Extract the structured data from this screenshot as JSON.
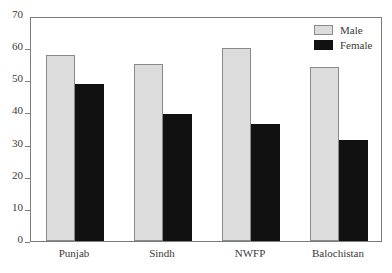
{
  "chart_data": {
    "type": "bar",
    "title": "",
    "subtitle": "",
    "xlabel": "",
    "ylabel": "",
    "categories": [
      "Punjab",
      "Sindh",
      "NWFP",
      "Balochistan"
    ],
    "series": [
      {
        "name": "Male",
        "color": "#dcdcdc",
        "values": [
          58,
          55,
          60,
          54
        ]
      },
      {
        "name": "Female",
        "color": "#111111",
        "values": [
          49,
          39.5,
          36.5,
          31.5
        ]
      }
    ],
    "ylim": [
      0,
      70
    ],
    "ytick_step": 10,
    "yticks": [
      0,
      10,
      20,
      30,
      40,
      50,
      60,
      70
    ],
    "ytick_labels": [
      "0",
      "10",
      "20",
      "30",
      "40",
      "50",
      "60",
      "70"
    ],
    "grid": false,
    "legend_position": "top-right",
    "frame": true
  },
  "legend": {
    "entries": [
      {
        "label": "Male",
        "swatch": "male-swatch"
      },
      {
        "label": "Female",
        "swatch": "female-swatch"
      }
    ]
  }
}
